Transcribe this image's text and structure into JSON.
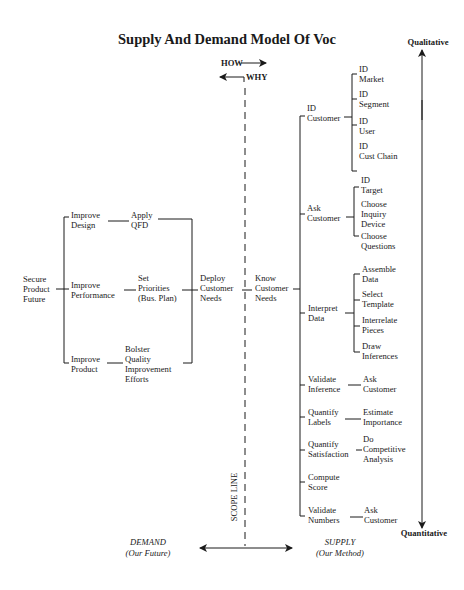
{
  "title": "Supply And Demand Model Of Voc",
  "axis": {
    "top_label": "Qualitative",
    "bottom_label": "Quantitative",
    "how_label": "HOW",
    "why_label": "WHY",
    "scope_label": "SCOPE LINE",
    "demand_label": "DEMAND",
    "demand_sub": "(Our Future)",
    "supply_label": "SUPPLY",
    "supply_sub": "(Our Method)"
  },
  "demand": {
    "root": [
      "Secure",
      "Product",
      "Future"
    ],
    "branches": [
      {
        "label": [
          "Improve",
          "Design"
        ],
        "action": [
          "Apply",
          "QFD"
        ]
      },
      {
        "label": [
          "Improve",
          "Performance"
        ],
        "action": [
          "Set",
          "Priorities",
          "(Bus. Plan)"
        ]
      },
      {
        "label": [
          "Improve",
          "Product"
        ],
        "action": [
          "Bolster",
          "Quality",
          "Improvement",
          "Efforts"
        ]
      }
    ],
    "deploy": [
      "Deploy",
      "Customer",
      "Needs"
    ]
  },
  "supply": {
    "root": [
      "Know",
      "Customer",
      "Needs"
    ],
    "branches": [
      {
        "label": [
          "ID",
          "Customer"
        ],
        "children": [
          [
            "ID",
            "Market"
          ],
          [
            "ID",
            "Segment"
          ],
          [
            "ID",
            "User"
          ],
          [
            "ID",
            "Cust Chain"
          ]
        ]
      },
      {
        "label": [
          "Ask",
          "Customer"
        ],
        "children": [
          [
            "ID",
            "Target"
          ],
          [
            "Choose",
            "Inquiry",
            "Device"
          ],
          [
            "Choose",
            "Questions"
          ]
        ]
      },
      {
        "label": [
          "Interpret",
          "Data"
        ],
        "children": [
          [
            "Assemble",
            "Data"
          ],
          [
            "Select",
            "Template"
          ],
          [
            "Interrelate",
            "Pieces"
          ],
          [
            "Draw",
            "Inferences"
          ]
        ]
      },
      {
        "label": [
          "Validate",
          "Inference"
        ],
        "children": [
          [
            "Ask",
            "Customer"
          ]
        ]
      },
      {
        "label": [
          "Quantify",
          "Labels"
        ],
        "children": [
          [
            "Estimate",
            "Importance"
          ]
        ]
      },
      {
        "label": [
          "Quantify",
          "Satisfaction"
        ],
        "children": [
          [
            "Do",
            "Competitive",
            "Analysis"
          ]
        ]
      },
      {
        "label": [
          "Compute",
          "Score"
        ],
        "children": []
      },
      {
        "label": [
          "Validate",
          "Numbers"
        ],
        "children": [
          [
            "Ask",
            "Customer"
          ]
        ]
      }
    ]
  }
}
